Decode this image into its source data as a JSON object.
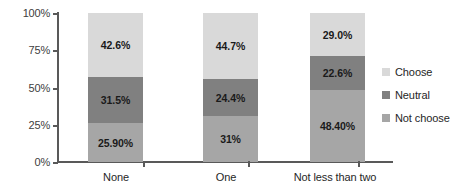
{
  "chart_data": {
    "type": "bar",
    "subtype": "100% stacked bar",
    "title": "",
    "xlabel": "",
    "ylabel": "",
    "ylim": [
      0,
      100
    ],
    "yticks": [
      "0%",
      "25%",
      "50%",
      "75%",
      "100%"
    ],
    "ytick_values": [
      0,
      25,
      50,
      75,
      100
    ],
    "grid": false,
    "legend_position": "right",
    "categories": [
      "None",
      "One",
      "Not less than two"
    ],
    "series": [
      {
        "name": "Not choose",
        "color": "#A6A6A6",
        "values": [
          25.9,
          31.0,
          48.4
        ],
        "labels": [
          "25.90%",
          "31%",
          "48.40%"
        ]
      },
      {
        "name": "Neutral",
        "color": "#808080",
        "values": [
          31.5,
          24.4,
          22.6
        ],
        "labels": [
          "31.5%",
          "24.4%",
          "22.6%"
        ]
      },
      {
        "name": "Choose",
        "color": "#D9D9D9",
        "values": [
          42.6,
          44.7,
          29.0
        ],
        "labels": [
          "42.6%",
          "44.7%",
          "29.0%"
        ]
      }
    ],
    "legend_entries": [
      {
        "label": "Choose",
        "color": "#D9D9D9"
      },
      {
        "label": "Neutral",
        "color": "#808080"
      },
      {
        "label": "Not choose",
        "color": "#A6A6A6"
      }
    ],
    "axis_color": "#595959"
  }
}
